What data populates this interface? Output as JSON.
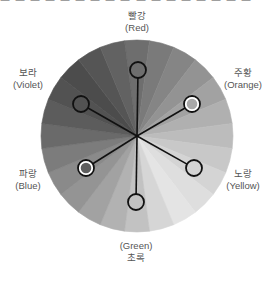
{
  "top_fragment": "ㅡ ㅡ ㅡ ㅡ ㅡ ㅡ ㅡ ㅡ ㅡ ㅡ ㅡ ㅡ ㅡ ㅡ ㅡ ㅡ ㅡ",
  "wheel": {
    "center": [
      137,
      136
    ],
    "radius": 96,
    "wedge_count": 24,
    "wedge_grays": [
      "#6e6e6e",
      "#7a7a7a",
      "#858585",
      "#939393",
      "#a2a2a2",
      "#b0b0b0",
      "#bcbcbc",
      "#c8c8c8",
      "#d4d4d4",
      "#dedede",
      "#e4e4e4",
      "#d6d6d6",
      "#c2c2c2",
      "#b2b2b2",
      "#a2a2a2",
      "#949494",
      "#8a8a8a",
      "#7c7c7c",
      "#6a6a6a",
      "#5c5c5c",
      "#525252",
      "#4c4c4c",
      "#555555",
      "#626262"
    ]
  },
  "colors": [
    {
      "id": "red",
      "ko": "빨강",
      "en": "(Red)",
      "marker": [
        138,
        70
      ],
      "highlight": false,
      "fill": "none"
    },
    {
      "id": "orange",
      "ko": "주황",
      "en": "(Orange)",
      "marker": [
        192,
        104
      ],
      "highlight": true,
      "fill": "#a8a8a8"
    },
    {
      "id": "yellow",
      "ko": "노랑",
      "en": "(Yellow)",
      "marker": [
        194,
        168
      ],
      "highlight": false,
      "fill": "none"
    },
    {
      "id": "green",
      "ko": "초록",
      "en": "(Green)",
      "marker": [
        136,
        202
      ],
      "highlight": false,
      "fill": "none"
    },
    {
      "id": "blue",
      "ko": "파랑",
      "en": "(Blue)",
      "marker": [
        86,
        168
      ],
      "highlight": true,
      "fill": "#5e5e5e"
    },
    {
      "id": "violet",
      "ko": "보라",
      "en": "(Violet)",
      "marker": [
        81,
        104
      ],
      "highlight": false,
      "fill": "none"
    }
  ]
}
